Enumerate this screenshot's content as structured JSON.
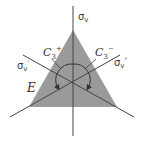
{
  "diagram": {
    "colors": {
      "triangle": "#9a9a9a",
      "lines": "#444444",
      "background": "#ffffff"
    },
    "labels": {
      "sigma_v": {
        "symbol": "σ",
        "sub": "v",
        "sup": ""
      },
      "sigma_v_prime": {
        "symbol": "σ",
        "sub": "v",
        "sup": "'"
      },
      "sigma_v_double_prime": {
        "symbol": "σ",
        "sub": "v",
        "sup": "\""
      },
      "c3_plus": {
        "symbol": "C",
        "sub": "3",
        "sup": "+"
      },
      "c3_minus": {
        "symbol": "C",
        "sub": "3",
        "sup": "−"
      },
      "identity": "E"
    }
  }
}
